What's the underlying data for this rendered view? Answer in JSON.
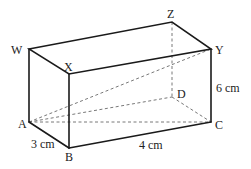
{
  "figure": {
    "type": "cuboid",
    "vertices": {
      "W": {
        "label": "W",
        "x": 29,
        "y": 49
      },
      "X": {
        "label": "X",
        "x": 69,
        "y": 74
      },
      "Y": {
        "label": "Y",
        "x": 211,
        "y": 49
      },
      "Z": {
        "label": "Z",
        "x": 172,
        "y": 22
      },
      "A": {
        "label": "A",
        "x": 29,
        "y": 122
      },
      "B": {
        "label": "B",
        "x": 69,
        "y": 148
      },
      "C": {
        "label": "C",
        "x": 211,
        "y": 122
      },
      "D": {
        "label": "D",
        "x": 172,
        "y": 97
      }
    },
    "dimensions": {
      "AB": "3 cm",
      "BC": "4 cm",
      "CY": "6 cm"
    },
    "hidden_edges": [
      "ZD",
      "AD",
      "DC",
      "AC",
      "AY"
    ]
  }
}
